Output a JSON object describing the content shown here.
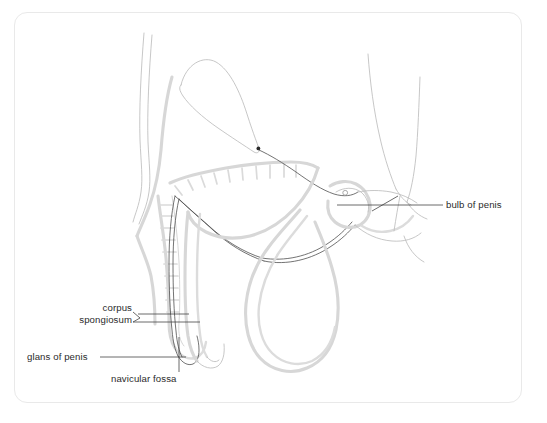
{
  "figure": {
    "kind": "anatomical-line-diagram",
    "view": "sagittal",
    "frame": {
      "border_color": "#e9e9e9",
      "corner_radius_px": 13,
      "background": "#ffffff"
    },
    "palette": {
      "tissue_outline": "#d8d8d8",
      "tissue_outline_dark": "#b9b9b9",
      "urethra_line": "#4a4a4a",
      "hatching": "#d9d9d9",
      "leader_line": "#3a3a3a",
      "label_text": "#2b2b2b",
      "marker_dot": "#2a2a2a"
    },
    "labels": [
      {
        "id": "bulb-of-penis",
        "text": "bulb of penis",
        "side": "right",
        "lines": 1,
        "leader": "horizontal line running left from the text to the bulb region, with a short oblique tick crossing it"
      },
      {
        "id": "corpus-spongiosum",
        "text_line_1": "corpus",
        "text_line_2": "spongiosum",
        "side": "left",
        "lines": 2,
        "leader": "two horizontal lines running right from the text, joined by a short angled bracket at the text end"
      },
      {
        "id": "glans-of-penis",
        "text": "glans of penis",
        "side": "left",
        "lines": 1,
        "leader": "horizontal line running right from the text to the glans"
      },
      {
        "id": "navicular-fossa",
        "text": "navicular fossa",
        "side": "bottom-left",
        "lines": 1,
        "leader": "vertical line running up from the text into the fossa"
      }
    ],
    "structures": [
      "bladder",
      "bladder neck marker dot",
      "prostatic urethra",
      "rectum with hatched wall",
      "anterior abdominal wall",
      "penile shaft folded downward",
      "corpus spongiosum",
      "glans of penis",
      "navicular fossa",
      "bulb of penis",
      "scrotum",
      "thigh outline",
      "small circular marker near bulb"
    ]
  }
}
